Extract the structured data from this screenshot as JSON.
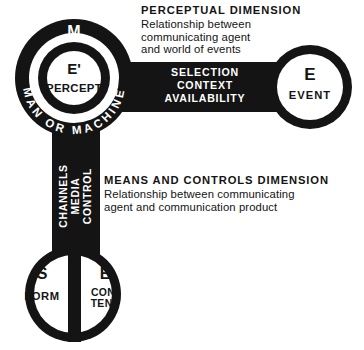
{
  "figure": {
    "title_visible": false,
    "colors": {
      "ink": "#141414",
      "paper": "#ffffff"
    }
  },
  "nodes": {
    "agent": {
      "ring_label": "MAN OR MACHINE",
      "ring_letter": "M",
      "inner_symbol": "E'",
      "inner_label": "PERCEPT"
    },
    "event": {
      "symbol": "E",
      "label": "EVENT"
    },
    "product_left": {
      "symbol": "S",
      "label": "FORM"
    },
    "product_right": {
      "symbol": "E",
      "label_line1": "CON-",
      "label_line2": "TENT"
    }
  },
  "connectors": {
    "horizontal_bar": {
      "line1": "SELECTION",
      "line2": "CONTEXT",
      "line3": "AVAILABILITY"
    },
    "vertical_bar": {
      "line1": "CHANNELS",
      "line2": "MEDIA",
      "line3": "CONTROL"
    }
  },
  "annotations": {
    "perceptual": {
      "heading": "PERCEPTUAL  DIMENSION",
      "desc_line1": "Relationship between",
      "desc_line2": "communicating agent",
      "desc_line3": "and world of events"
    },
    "means": {
      "heading": "MEANS AND CONTROLS DIMENSION",
      "desc_line1": "Relationship between communicating",
      "desc_line2": "agent and communication product"
    }
  }
}
